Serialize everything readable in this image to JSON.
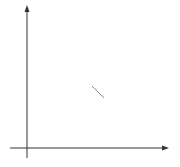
{
  "chart_data": {
    "type": "line",
    "title": "",
    "xlabel": "x",
    "ylabel": "y",
    "curve_label": "y = e",
    "curve_label_exp": "x",
    "function": "y = e^x",
    "x_ticks": [
      "0",
      "1",
      "2",
      "3"
    ],
    "y_ticks": [
      "1"
    ],
    "xlim": [
      0,
      3.1
    ],
    "ylim": [
      0,
      17.5
    ],
    "grid": true,
    "series": [
      {
        "name": "y = e^x",
        "x": [
          0,
          0.5,
          1.0,
          1.5,
          2.0,
          2.5,
          2.86
        ],
        "values": [
          1.0,
          1.65,
          2.72,
          4.48,
          7.39,
          12.18,
          17.46
        ]
      }
    ],
    "colors": {
      "curve": "#555555",
      "grid": "#c8c8c8",
      "axis": "#333333"
    }
  }
}
